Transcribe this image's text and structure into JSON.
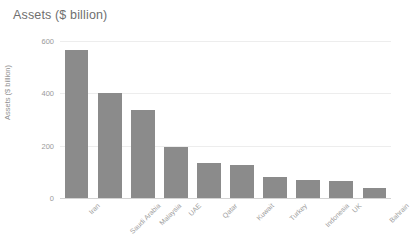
{
  "chart_data": {
    "type": "bar",
    "title": "Assets ($ billion)",
    "xlabel": "",
    "ylabel": "Assets ($ billion)",
    "categories": [
      "Iran",
      "Saudi Arabia",
      "Malaysia",
      "UAE",
      "Qatar",
      "Kuwait",
      "Turkey",
      "Indonesia",
      "UK",
      "Bahrain"
    ],
    "values": [
      565,
      400,
      335,
      196,
      133,
      126,
      80,
      67,
      64,
      40
    ],
    "ylim": [
      0,
      600
    ],
    "yticks": [
      0,
      200,
      400,
      600
    ],
    "ytick_labels": [
      "0",
      "200",
      "400",
      "600"
    ],
    "grid": true,
    "legend": false,
    "legend_position": "none",
    "bar_color": "#8b8b8b",
    "gridline_color": "#ededed",
    "axis_color": "#d3d3d3",
    "title_color": "#6f6f6f",
    "tick_label_color": "#9a9a9a",
    "background_color": "#ffffff"
  }
}
